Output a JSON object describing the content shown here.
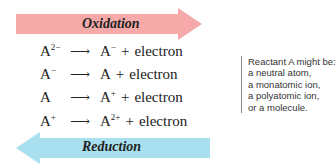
{
  "colors": {
    "oxidation_arrow": "#f5aaa9",
    "reduction_arrow": "#a9e0ef",
    "text": "#222222",
    "note_border": "#888888"
  },
  "oxidation": {
    "label": "Oxidation",
    "direction": "right",
    "icon": "arrow-right-icon"
  },
  "reduction": {
    "label": "Reduction",
    "direction": "left",
    "icon": "arrow-left-icon"
  },
  "equations": [
    {
      "reactant_base": "A",
      "reactant_charge": "2−",
      "arrow": "⟶",
      "product_base": "A",
      "product_charge": "−",
      "plus": "+",
      "electron": "electron"
    },
    {
      "reactant_base": "A",
      "reactant_charge": "−",
      "arrow": "⟶",
      "product_base": "A",
      "product_charge": "",
      "plus": "+",
      "electron": "electron"
    },
    {
      "reactant_base": "A",
      "reactant_charge": "",
      "arrow": "⟶",
      "product_base": "A",
      "product_charge": "+",
      "plus": "+",
      "electron": "electron"
    },
    {
      "reactant_base": "A",
      "reactant_charge": "+",
      "arrow": "⟶",
      "product_base": "A",
      "product_charge": "2+",
      "plus": "+",
      "electron": "electron"
    }
  ],
  "note": {
    "lines": [
      "Reactant A might be:",
      "a neutral atom,",
      "a monatomic ion,",
      "a polyatomic ion,",
      "or a molecule."
    ]
  }
}
